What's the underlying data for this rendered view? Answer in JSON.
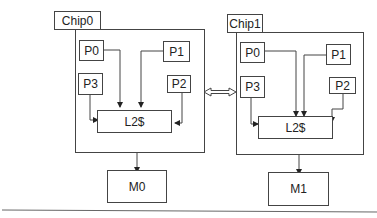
{
  "diagram": {
    "chips": [
      {
        "label": "Chip0",
        "processors": [
          "P0",
          "P1",
          "P2",
          "P3"
        ],
        "cache": "L2$",
        "memory": "M0"
      },
      {
        "label": "Chip1",
        "processors": [
          "P0",
          "P1",
          "P2",
          "P3"
        ],
        "cache": "L2$",
        "memory": "M1"
      }
    ],
    "interconnect": "bidirectional-arrow",
    "colors": {
      "stroke": "#444444",
      "background": "#ffffff",
      "text": "#222222"
    }
  }
}
